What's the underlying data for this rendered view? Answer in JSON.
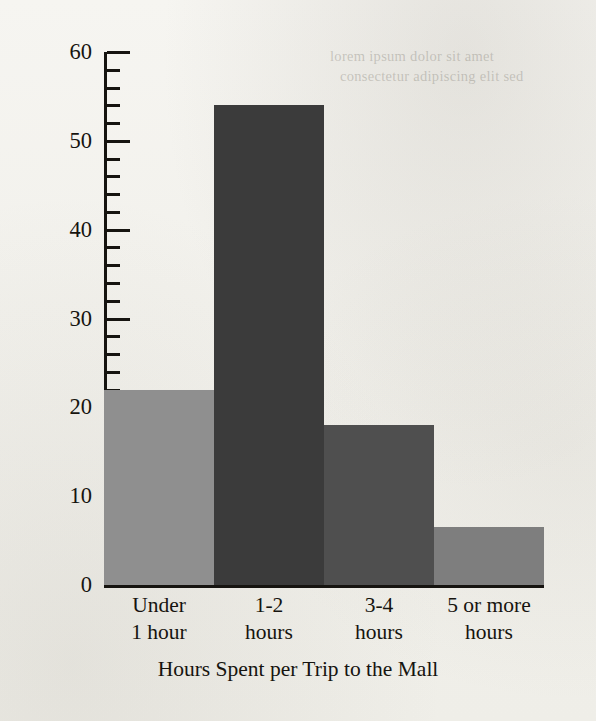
{
  "chart_data": {
    "type": "bar",
    "title": "",
    "xlabel": "Hours Spent per Trip to the Mall",
    "ylabel": "Number of People",
    "categories": [
      "Under 1 hour",
      "1-2 hours",
      "3-4 hours",
      "5 or more hours"
    ],
    "category_lines": [
      [
        "Under",
        "1 hour"
      ],
      [
        "1-2",
        "hours"
      ],
      [
        "3-4",
        "hours"
      ],
      [
        "5 or more",
        "hours"
      ]
    ],
    "values": [
      22,
      54,
      18,
      6.5
    ],
    "bar_colors": [
      "#8f8f8f",
      "#3b3b3b",
      "#4f4f4f",
      "#7e7e7e"
    ],
    "ylim": [
      0,
      60
    ],
    "ytick_labels": [
      "0",
      "10",
      "20",
      "30",
      "40",
      "50",
      "60"
    ],
    "ytick_values": [
      0,
      10,
      20,
      30,
      40,
      50,
      60
    ],
    "minor_tick_step": 2,
    "grid": false,
    "legend": null
  },
  "page": {
    "background_color": "#f3f2ee",
    "ink_color": "#16140f",
    "bleedthrough_line1": "lorem ipsum dolor sit amet",
    "bleedthrough_line2": "consectetur adipiscing elit sed"
  }
}
